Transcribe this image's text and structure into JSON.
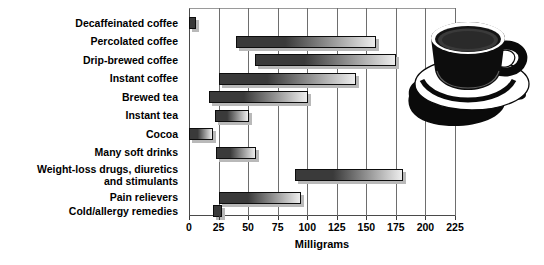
{
  "chart_data": {
    "type": "bar",
    "subtype": "horizontal-range-bar",
    "title": "",
    "xlabel": "Milligrams",
    "ylabel": "",
    "xlim": [
      0,
      225
    ],
    "xticks": [
      0,
      25,
      50,
      75,
      100,
      125,
      150,
      175,
      200,
      225
    ],
    "xticklabels": [
      "0",
      "25",
      "50",
      "75",
      "100",
      "125",
      "150",
      "175",
      "200",
      "225"
    ],
    "grid": true,
    "legend": null,
    "categories": [
      "Decaffeinated coffee",
      "Percolated coffee",
      "Drip-brewed coffee",
      "Instant coffee",
      "Brewed tea",
      "Instant tea",
      "Cocoa",
      "Many soft drinks",
      "Weight-loss drugs, diuretics\nand stimulants",
      "Pain relievers",
      "Cold/allergy remedies"
    ],
    "ranges": [
      {
        "label": "Decaffeinated coffee",
        "low": 0,
        "high": 5
      },
      {
        "label": "Percolated coffee",
        "low": 40,
        "high": 158
      },
      {
        "label": "Drip-brewed coffee",
        "low": 56,
        "high": 175
      },
      {
        "label": "Instant coffee",
        "low": 25,
        "high": 141
      },
      {
        "label": "Brewed tea",
        "low": 17,
        "high": 101
      },
      {
        "label": "Instant tea",
        "low": 22,
        "high": 51
      },
      {
        "label": "Cocoa",
        "low": 0,
        "high": 20
      },
      {
        "label": "Many soft drinks",
        "low": 23,
        "high": 57
      },
      {
        "label": "Weight-loss drugs, diuretics and stimulants",
        "low": 90,
        "high": 181
      },
      {
        "label": "Pain relievers",
        "low": 25,
        "high": 95
      },
      {
        "label": "Cold/allergy remedies",
        "low": 20,
        "high": 28
      }
    ]
  },
  "colors": {
    "bar_dark": "#3a3a3a",
    "bar_light": "#ededed",
    "bar_outline": "#0d0d0d",
    "bar_shadow": "#b9b9b9",
    "gridline": "#6e6e6e",
    "axis": "#3a3a3a",
    "text": "#000000",
    "background": "#ffffff",
    "cup": "#0a0a0a"
  },
  "illustration": {
    "name": "coffee-cup-and-saucer"
  }
}
